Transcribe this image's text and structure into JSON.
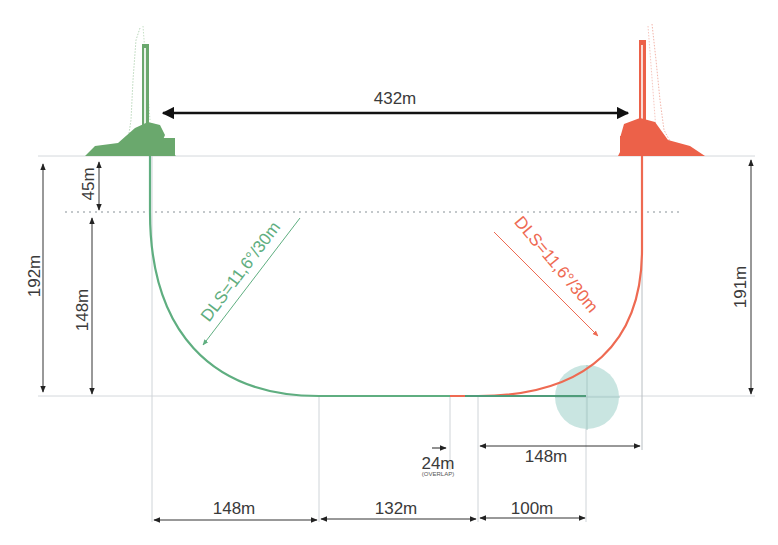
{
  "colors": {
    "green": "#5fae80",
    "red": "#ee6a52",
    "dim_line": "#333333",
    "guide": "#c9cfd3",
    "target": "#bfe1dc"
  },
  "rigs": {
    "left": {
      "label": "green-rig",
      "color": "#6aa86d"
    },
    "right": {
      "label": "red-rig",
      "color": "#ec6149"
    }
  },
  "dimensions": {
    "rig_spacing": "432m",
    "left_total_depth": "192m",
    "left_kickoff_depth": "45m",
    "left_build_depth": "148m",
    "right_total_depth": "191m",
    "left_dls": "DLS=11,6°/30m",
    "right_dls": "DLS=11,6°/30m",
    "overlap": "24m",
    "overlap_note": "(OVERLAP)",
    "right_horizontal_offset": "148m",
    "bottom_left_radius": "148m",
    "bottom_middle": "132m",
    "bottom_right": "100m"
  }
}
